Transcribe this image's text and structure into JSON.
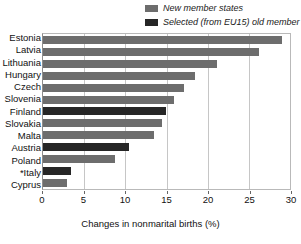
{
  "legend": {
    "position": "top-right",
    "items": [
      {
        "label": "New member states",
        "color": "#6d6d6d",
        "swatch": "legend-swatch-new"
      },
      {
        "label": "Selected (from EU15) old member states",
        "color": "#262626",
        "swatch": "legend-swatch-old"
      }
    ]
  },
  "colors": {
    "new_member_states": "#6d6d6d",
    "old_member_states": "#262626",
    "gridline": "#c6c6c6",
    "border": "#b9b9b9",
    "background": "#ffffff"
  },
  "chart_data": {
    "type": "bar",
    "orientation": "horizontal",
    "title": "",
    "subtitle": "",
    "xlabel": "Changes in nonmarital births (%)",
    "ylabel": "",
    "xlim": [
      0,
      30
    ],
    "ylim": null,
    "grid": true,
    "xticks": [
      0,
      5,
      10,
      15,
      20,
      25,
      30
    ],
    "xticklabels": [
      "0",
      "5",
      "10",
      "15",
      "20",
      "25",
      "30"
    ],
    "legend_position": "top-right",
    "categories": [
      "Estonia",
      "Latvia",
      "Lithuania",
      "Hungary",
      "Czech",
      "Slovenia",
      "Finland",
      "Slovakia",
      "Malta",
      "Austria",
      "Poland",
      "*Italy",
      "Cyprus"
    ],
    "values": [
      29.0,
      26.2,
      21.1,
      18.5,
      17.1,
      15.9,
      14.9,
      14.5,
      13.5,
      10.4,
      8.7,
      3.4,
      2.9
    ],
    "groups": [
      "new",
      "new",
      "new",
      "new",
      "new",
      "new",
      "old",
      "new",
      "new",
      "old",
      "new",
      "old",
      "new"
    ],
    "series": [
      {
        "name": "New member states",
        "color": "#6d6d6d",
        "points": [
          {
            "category": "Estonia",
            "value": 29.0
          },
          {
            "category": "Latvia",
            "value": 26.2
          },
          {
            "category": "Lithuania",
            "value": 21.1
          },
          {
            "category": "Hungary",
            "value": 18.5
          },
          {
            "category": "Czech",
            "value": 17.1
          },
          {
            "category": "Slovenia",
            "value": 15.9
          },
          {
            "category": "Slovakia",
            "value": 14.5
          },
          {
            "category": "Malta",
            "value": 13.5
          },
          {
            "category": "Poland",
            "value": 8.7
          },
          {
            "category": "Cyprus",
            "value": 2.9
          }
        ]
      },
      {
        "name": "Selected (from EU15) old member states",
        "color": "#262626",
        "points": [
          {
            "category": "Finland",
            "value": 14.9
          },
          {
            "category": "Austria",
            "value": 10.4
          },
          {
            "category": "*Italy",
            "value": 3.4
          }
        ]
      }
    ],
    "annotations": [
      "*Italy"
    ]
  }
}
